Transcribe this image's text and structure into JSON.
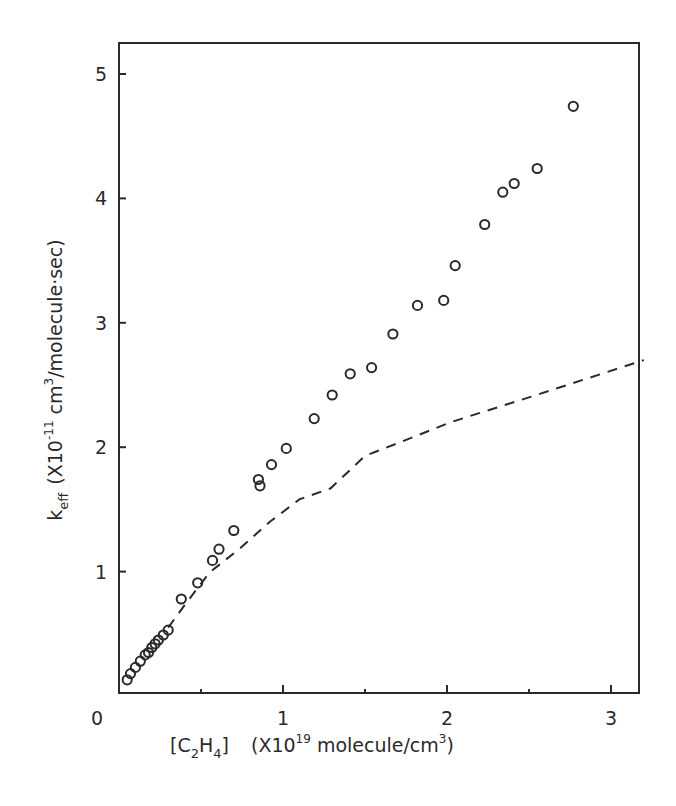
{
  "chart_data": {
    "type": "scatter",
    "title": "",
    "xlabel": "[C2H4]  (X10^19 molecule/cm^3)",
    "ylabel": "k_eff (X10^-11 cm^3/molecule·sec)",
    "xlim": [
      0,
      3.2
    ],
    "ylim": [
      0,
      5.25
    ],
    "x_ticks": [
      0,
      1,
      2,
      3
    ],
    "x_minor_ticks": [
      0.5,
      1.5,
      2.5
    ],
    "y_ticks": [
      1,
      2,
      3,
      4,
      5
    ],
    "grid": false,
    "legend": null,
    "series": [
      {
        "name": "measured",
        "style": "open-circle",
        "x": [
          0.05,
          0.07,
          0.1,
          0.13,
          0.16,
          0.18,
          0.2,
          0.22,
          0.24,
          0.27,
          0.3,
          0.38,
          0.48,
          0.57,
          0.61,
          0.7,
          0.85,
          0.86,
          0.93,
          1.02,
          1.19,
          1.3,
          1.41,
          1.54,
          1.67,
          1.82,
          1.98,
          2.05,
          2.23,
          2.34,
          2.41,
          2.55,
          2.77
        ],
        "y": [
          0.13,
          0.18,
          0.23,
          0.28,
          0.33,
          0.35,
          0.39,
          0.42,
          0.45,
          0.49,
          0.53,
          0.78,
          0.91,
          1.09,
          1.18,
          1.33,
          1.74,
          1.69,
          1.86,
          1.99,
          2.23,
          2.42,
          2.59,
          2.64,
          2.91,
          3.14,
          3.18,
          3.46,
          3.79,
          4.05,
          4.12,
          4.24,
          4.74
        ]
      },
      {
        "name": "calculated",
        "style": "dashed-line",
        "x": [
          0.3,
          0.4,
          0.55,
          0.74,
          0.92,
          1.1,
          1.29,
          1.5,
          1.83,
          2.02,
          2.5,
          3.2
        ],
        "y": [
          0.55,
          0.73,
          0.99,
          1.19,
          1.4,
          1.58,
          1.67,
          1.93,
          2.1,
          2.2,
          2.4,
          2.7
        ]
      }
    ]
  },
  "axes": {
    "x_tick_labels": [
      "0",
      "1",
      "2",
      "3"
    ],
    "y_tick_labels": [
      "1",
      "2",
      "3",
      "4",
      "5"
    ],
    "xlabel_parts": {
      "bracket_open": "[C",
      "sub2": "2",
      "h": "H",
      "sub4": "4",
      "bracket_close": "]",
      "unit_prefix": "(X10",
      "exp": "19",
      "unit_suffix": " molecule/cm",
      "exp3": "3",
      "close": ")"
    },
    "ylabel_parts": {
      "k": "k",
      "sub": "eff",
      "unit_prefix": "(X10",
      "exp": "-11",
      "unit_mid": " cm",
      "exp3": "3",
      "unit_suffix": "/molecule·sec)"
    }
  },
  "colors": {
    "ink": "#2a2a2a",
    "background": "#ffffff"
  }
}
